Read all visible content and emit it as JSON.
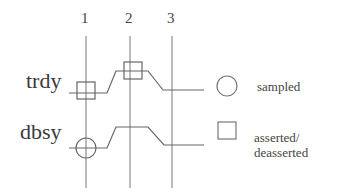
{
  "diagram": {
    "type": "timing-diagram",
    "clock_markers": [
      {
        "label": "1",
        "x": 86
      },
      {
        "label": "2",
        "x": 130
      },
      {
        "label": "3",
        "x": 172
      }
    ],
    "signals": [
      {
        "name": "trdy",
        "event_at_1": "asserted/deasserted",
        "event_at_2": "asserted/deasserted"
      },
      {
        "name": "dbsy",
        "event_at_1": "sampled"
      }
    ],
    "legend": [
      {
        "symbol": "circle",
        "label": "sampled"
      },
      {
        "symbol": "square",
        "label": "asserted/\ndeasserted",
        "label_line1": "asserted/",
        "label_line2": "deasserted"
      }
    ],
    "line_color": "#666666"
  }
}
